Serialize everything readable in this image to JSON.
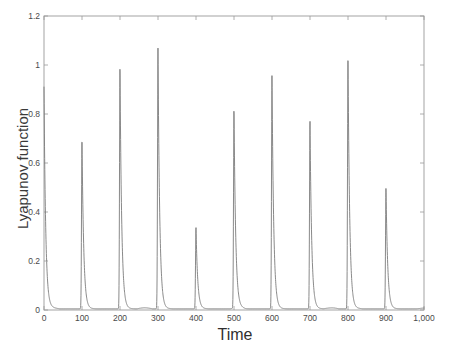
{
  "chart_data": {
    "type": "line",
    "title": "",
    "xlabel": "Time",
    "ylabel": "Lyapunov function",
    "xlim": [
      0,
      1000
    ],
    "ylim": [
      0,
      1.2
    ],
    "grid": false,
    "legend": null,
    "line_color": "#7c7c7c",
    "frame_color": "#9a9a9a",
    "tick_color": "#4a4a4a",
    "background": "#ffffff",
    "xticks": [
      0,
      100,
      200,
      300,
      400,
      500,
      600,
      700,
      800,
      900,
      1000
    ],
    "xtick_labels": [
      "0",
      "100",
      "200",
      "300",
      "400",
      "500",
      "600",
      "700",
      "800",
      "900",
      "1,000"
    ],
    "yticks": [
      0,
      0.2,
      0.4,
      0.6,
      0.8,
      1.0,
      1.2
    ],
    "ytick_labels": [
      "0",
      "0.2",
      "0.4",
      "0.6",
      "0.8",
      "1",
      "1.2"
    ],
    "series": [
      {
        "name": "Lyapunov function",
        "peaks": [
          {
            "t": 0,
            "value": 0.91
          },
          {
            "t": 100,
            "value": 0.7
          },
          {
            "t": 200,
            "value": 0.99
          },
          {
            "t": 300,
            "value": 1.07
          },
          {
            "t": 400,
            "value": 0.34
          },
          {
            "t": 500,
            "value": 0.82
          },
          {
            "t": 600,
            "value": 0.96
          },
          {
            "t": 700,
            "value": 0.77
          },
          {
            "t": 800,
            "value": 1.04
          },
          {
            "t": 900,
            "value": 0.5
          }
        ],
        "baseline": 0.005,
        "decay_tau": 4.5,
        "rise_tau": 1.2
      }
    ]
  },
  "axes": {
    "ylabel": "Lyapunov function",
    "xlabel": "Time"
  }
}
